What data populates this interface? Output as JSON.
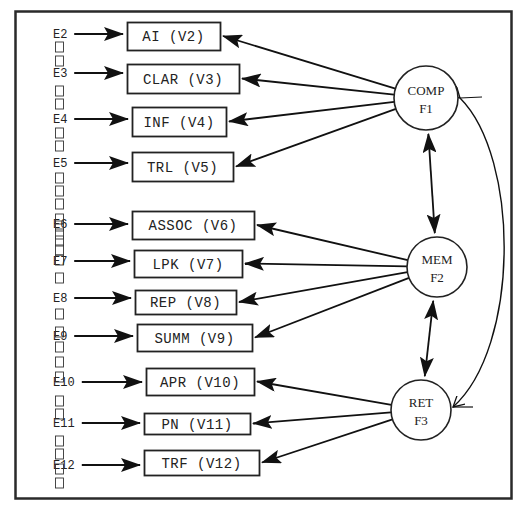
{
  "diagram": {
    "type": "confirmatory factor analysis path diagram",
    "factors": [
      {
        "id": "F1",
        "name": "COMP",
        "label": "F1",
        "cx": 426,
        "cy": 98,
        "r": 32
      },
      {
        "id": "F2",
        "name": "MEM",
        "label": "F2",
        "cx": 437,
        "cy": 267,
        "r": 30
      },
      {
        "id": "F3",
        "name": "RET",
        "label": "F3",
        "cx": 421,
        "cy": 410,
        "r": 30
      }
    ],
    "variables": [
      {
        "id": "V2",
        "label": "AI (V2)",
        "error": "E2",
        "factor": "F1",
        "x": 127,
        "y": 22,
        "w": 93,
        "h": 28,
        "ey": 34
      },
      {
        "id": "V3",
        "label": "CLAR (V3)",
        "error": "E3",
        "factor": "F1",
        "x": 127,
        "y": 64,
        "w": 112,
        "h": 29,
        "ey": 73
      },
      {
        "id": "V4",
        "label": "INF (V4)",
        "error": "E4",
        "factor": "F1",
        "x": 132,
        "y": 107,
        "w": 94,
        "h": 29,
        "ey": 119
      },
      {
        "id": "V5",
        "label": "TRL (V5)",
        "error": "E5",
        "factor": "F1",
        "x": 132,
        "y": 152,
        "w": 101,
        "h": 29,
        "ey": 163
      },
      {
        "id": "V6",
        "label": "ASSOC (V6)",
        "error": "E6",
        "factor": "F2",
        "x": 132,
        "y": 211,
        "w": 122,
        "h": 28,
        "ey": 224
      },
      {
        "id": "V7",
        "label": "LPK (V7)",
        "error": "E7",
        "factor": "F2",
        "x": 134,
        "y": 250,
        "w": 108,
        "h": 27,
        "ey": 261
      },
      {
        "id": "V8",
        "label": "REP (V8)",
        "error": "E8",
        "factor": "F2",
        "x": 135,
        "y": 290,
        "w": 101,
        "h": 24,
        "ey": 298
      },
      {
        "id": "V9",
        "label": "SUMM (V9)",
        "error": "E9",
        "factor": "F2",
        "x": 137,
        "y": 324,
        "w": 115,
        "h": 27,
        "ey": 336
      },
      {
        "id": "V10",
        "label": "APR (V10)",
        "error": "E10",
        "factor": "F3",
        "x": 146,
        "y": 368,
        "w": 108,
        "h": 27,
        "ey": 382
      },
      {
        "id": "V11",
        "label": "PN (V11)",
        "error": "E11",
        "factor": "F3",
        "x": 144,
        "y": 413,
        "w": 106,
        "h": 21,
        "ey": 423
      },
      {
        "id": "V12",
        "label": "TRF (V12)",
        "error": "E12",
        "factor": "F3",
        "x": 144,
        "y": 450,
        "w": 115,
        "h": 25,
        "ey": 465
      }
    ],
    "covariances": [
      {
        "from": "F1",
        "to": "F2"
      },
      {
        "from": "F2",
        "to": "F3"
      },
      {
        "from": "F1",
        "to": "F3",
        "curved": true
      }
    ]
  },
  "colors": {
    "line": "#1a1a1a",
    "background": "#ffffff",
    "frame": "#2a2a2a"
  }
}
